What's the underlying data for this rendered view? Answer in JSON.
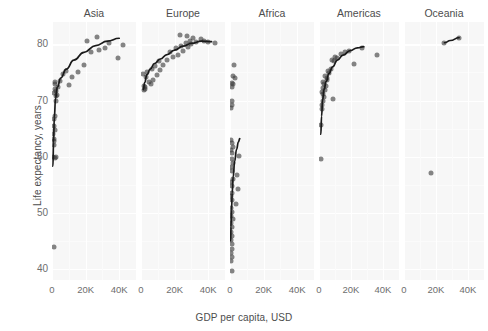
{
  "chart_data": {
    "type": "scatter",
    "title": "",
    "xlabel": "GDP per capita, USD",
    "ylabel": "Life expectancy, years",
    "xlim": [
      0,
      50000
    ],
    "ylim": [
      38,
      84
    ],
    "grid": true,
    "legend": "none",
    "facet_labels": [
      "Asia",
      "Europe",
      "Africa",
      "Americas",
      "Oceania"
    ],
    "x_tick_labels": [
      "0",
      "20K",
      "40K"
    ],
    "x_tick_values": [
      0,
      20000,
      40000
    ],
    "y_tick_labels": [
      "40",
      "50",
      "60",
      "70",
      "80"
    ],
    "y_tick_values": [
      40,
      50,
      60,
      70,
      80
    ],
    "annotation": "Each panel shows GDP per capita versus life expectancy with a LOESS trend line",
    "series": [
      {
        "name": "Asia",
        "marker": "circle",
        "color": "#3c3c3c",
        "trendline": "loess",
        "points": [
          [
            1030,
            43.8
          ],
          [
            700,
            59.9
          ],
          [
            1600,
            59.8
          ],
          [
            2200,
            59.9
          ],
          [
            1100,
            62.1
          ],
          [
            950,
            62.7
          ],
          [
            1300,
            63.1
          ],
          [
            800,
            64.1
          ],
          [
            1500,
            64.7
          ],
          [
            900,
            65.5
          ],
          [
            1200,
            66.7
          ],
          [
            1800,
            67.3
          ],
          [
            2600,
            70.0
          ],
          [
            2100,
            70.8
          ],
          [
            3100,
            71.0
          ],
          [
            1400,
            71.3
          ],
          [
            2400,
            71.7
          ],
          [
            1700,
            72.0
          ],
          [
            3500,
            72.4
          ],
          [
            2000,
            72.9
          ],
          [
            1900,
            73.3
          ],
          [
            4500,
            73.4
          ],
          [
            10200,
            72.8
          ],
          [
            12000,
            74.2
          ],
          [
            6300,
            74.8
          ],
          [
            15500,
            75.0
          ],
          [
            8400,
            75.3
          ],
          [
            19000,
            76.4
          ],
          [
            39000,
            77.6
          ],
          [
            23000,
            78.6
          ],
          [
            28000,
            79.0
          ],
          [
            31500,
            79.4
          ],
          [
            21000,
            80.7
          ],
          [
            26500,
            81.4
          ],
          [
            42000,
            79.9
          ],
          [
            34000,
            80.2
          ]
        ],
        "trend_path": [
          [
            560,
            58.3
          ],
          [
            900,
            62.5
          ],
          [
            1400,
            67.0
          ],
          [
            2100,
            70.4
          ],
          [
            3200,
            72.4
          ],
          [
            5200,
            74.0
          ],
          [
            8500,
            75.6
          ],
          [
            13000,
            77.2
          ],
          [
            19000,
            78.6
          ],
          [
            26000,
            79.8
          ],
          [
            33000,
            80.6
          ],
          [
            40000,
            81.1
          ]
        ]
      },
      {
        "name": "Europe",
        "marker": "circle",
        "color": "#3c3c3c",
        "trendline": "loess",
        "points": [
          [
            1800,
            71.8
          ],
          [
            2100,
            72.1
          ],
          [
            2300,
            72.4
          ],
          [
            2000,
            72.6
          ],
          [
            5900,
            72.9
          ],
          [
            4600,
            73.3
          ],
          [
            7100,
            73.7
          ],
          [
            2800,
            74.2
          ],
          [
            9600,
            74.5
          ],
          [
            1400,
            74.8
          ],
          [
            3400,
            75.1
          ],
          [
            11500,
            75.4
          ],
          [
            6400,
            75.6
          ],
          [
            8200,
            76.2
          ],
          [
            13000,
            76.4
          ],
          [
            10500,
            77.0
          ],
          [
            15500,
            77.3
          ],
          [
            19000,
            77.8
          ],
          [
            22000,
            78.2
          ],
          [
            17500,
            78.6
          ],
          [
            25000,
            78.9
          ],
          [
            21000,
            79.3
          ],
          [
            28000,
            79.5
          ],
          [
            24000,
            79.8
          ],
          [
            30000,
            80.0
          ],
          [
            26500,
            80.2
          ],
          [
            33000,
            80.5
          ],
          [
            29000,
            80.6
          ],
          [
            35500,
            80.9
          ],
          [
            31000,
            81.2
          ],
          [
            27500,
            81.5
          ],
          [
            23500,
            81.7
          ],
          [
            44000,
            80.2
          ],
          [
            37500,
            80.7
          ],
          [
            40000,
            80.4
          ]
        ],
        "trend_path": [
          [
            1400,
            72.0
          ],
          [
            2200,
            73.2
          ],
          [
            3500,
            74.6
          ],
          [
            5500,
            75.6
          ],
          [
            8000,
            76.6
          ],
          [
            11500,
            77.4
          ],
          [
            15500,
            78.2
          ],
          [
            20000,
            79.0
          ],
          [
            25000,
            79.7
          ],
          [
            30000,
            80.2
          ],
          [
            36000,
            80.6
          ],
          [
            42000,
            80.5
          ]
        ]
      },
      {
        "name": "Africa",
        "marker": "circle",
        "color": "#3c3c3c",
        "trendline": "loess",
        "points": [
          [
            2400,
            76.4
          ],
          [
            1600,
            74.3
          ],
          [
            3100,
            74.1
          ],
          [
            1200,
            73.2
          ],
          [
            1900,
            73.0
          ],
          [
            1400,
            72.4
          ],
          [
            900,
            70.0
          ],
          [
            1100,
            69.2
          ],
          [
            800,
            68.6
          ],
          [
            600,
            63.0
          ],
          [
            1000,
            62.5
          ],
          [
            1500,
            61.8
          ],
          [
            700,
            61.2
          ],
          [
            1300,
            60.6
          ],
          [
            5200,
            60.1
          ],
          [
            900,
            59.5
          ],
          [
            1800,
            58.9
          ],
          [
            500,
            58.1
          ],
          [
            1100,
            57.5
          ],
          [
            4200,
            56.8
          ],
          [
            1600,
            56.0
          ],
          [
            700,
            55.4
          ],
          [
            1200,
            54.8
          ],
          [
            4800,
            54.2
          ],
          [
            900,
            53.5
          ],
          [
            400,
            52.9
          ],
          [
            1400,
            52.2
          ],
          [
            3600,
            51.6
          ],
          [
            600,
            50.9
          ],
          [
            1000,
            50.2
          ],
          [
            800,
            49.5
          ],
          [
            1500,
            48.8
          ],
          [
            500,
            48.1
          ],
          [
            1100,
            47.4
          ],
          [
            700,
            46.6
          ],
          [
            1300,
            45.9
          ],
          [
            600,
            45.2
          ],
          [
            900,
            44.4
          ],
          [
            1000,
            43.6
          ],
          [
            500,
            42.9
          ],
          [
            1200,
            42.1
          ],
          [
            700,
            41.3
          ],
          [
            1400,
            39.6
          ]
        ],
        "trend_path": [
          [
            380,
            45.0
          ],
          [
            600,
            47.5
          ],
          [
            900,
            50.5
          ],
          [
            1300,
            53.5
          ],
          [
            1900,
            56.5
          ],
          [
            2800,
            59.2
          ],
          [
            3900,
            61.3
          ],
          [
            5000,
            62.6
          ],
          [
            5800,
            63.2
          ]
        ]
      },
      {
        "name": "Americas",
        "marker": "circle",
        "color": "#3c3c3c",
        "trendline": "loess",
        "points": [
          [
            1200,
            59.6
          ],
          [
            1400,
            65.6
          ],
          [
            2100,
            68.4
          ],
          [
            1700,
            69.2
          ],
          [
            2600,
            70.0
          ],
          [
            3100,
            70.6
          ],
          [
            2300,
            71.1
          ],
          [
            1900,
            71.5
          ],
          [
            3600,
            71.9
          ],
          [
            2800,
            72.3
          ],
          [
            4200,
            72.6
          ],
          [
            3300,
            73.0
          ],
          [
            2500,
            73.3
          ],
          [
            5100,
            73.6
          ],
          [
            4700,
            74.0
          ],
          [
            3900,
            74.4
          ],
          [
            6300,
            74.9
          ],
          [
            5500,
            75.3
          ],
          [
            7400,
            75.6
          ],
          [
            8800,
            70.2
          ],
          [
            9600,
            77.0
          ],
          [
            7900,
            77.3
          ],
          [
            11500,
            77.5
          ],
          [
            10300,
            77.8
          ],
          [
            22000,
            76.5
          ],
          [
            19000,
            78.9
          ],
          [
            27000,
            79.4
          ],
          [
            13500,
            78.3
          ],
          [
            16000,
            78.6
          ],
          [
            36000,
            78.2
          ]
        ],
        "trend_path": [
          [
            1150,
            64.0
          ],
          [
            1600,
            67.2
          ],
          [
            2300,
            70.2
          ],
          [
            3200,
            72.0
          ],
          [
            4500,
            73.4
          ],
          [
            6200,
            74.8
          ],
          [
            8500,
            76.0
          ],
          [
            11500,
            77.2
          ],
          [
            15000,
            78.1
          ],
          [
            19500,
            78.9
          ],
          [
            24000,
            79.4
          ],
          [
            28000,
            79.6
          ]
        ]
      },
      {
        "name": "Oceania",
        "marker": "circle",
        "color": "#3c3c3c",
        "trendline": "loess",
        "points": [
          [
            25300,
            80.2
          ],
          [
            34400,
            81.2
          ],
          [
            17000,
            57.0
          ]
        ],
        "trend_path": [
          [
            25300,
            80.3
          ],
          [
            29000,
            80.7
          ],
          [
            34400,
            81.2
          ]
        ]
      }
    ]
  }
}
